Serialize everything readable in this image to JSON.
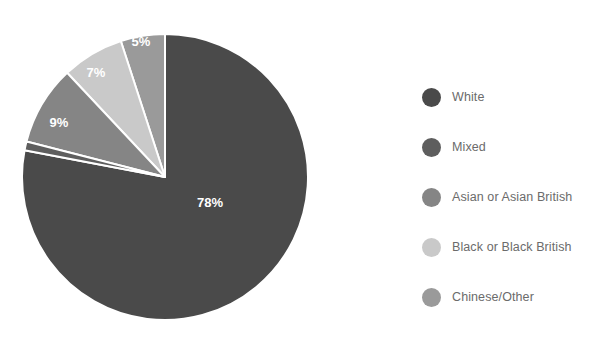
{
  "chart_data": {
    "type": "pie",
    "title": "",
    "xlabel": "",
    "ylabel": "",
    "unit": "%",
    "legend_position": "right",
    "grid": false,
    "start_angle_deg": 0,
    "direction": "clockwise",
    "categories": [
      "White",
      "Mixed",
      "Asian or Asian British",
      "Black or Black British",
      "Chinese/Other"
    ],
    "values": [
      78,
      1,
      9,
      7,
      5
    ],
    "data_labels": [
      "78%",
      "",
      "9%",
      "7%",
      "5%"
    ],
    "colors": [
      "#4a4a4a",
      "#5e5e5e",
      "#858585",
      "#c9c9c9",
      "#9a9a9a"
    ],
    "slices": [
      {
        "label": "White",
        "value": 78,
        "display": "78%",
        "color": "#4a4a4a",
        "label_shown": true
      },
      {
        "label": "Mixed",
        "value": 1,
        "display": "",
        "color": "#5e5e5e",
        "label_shown": false
      },
      {
        "label": "Asian or Asian British",
        "value": 9,
        "display": "9%",
        "color": "#858585",
        "label_shown": true
      },
      {
        "label": "Black or Black British",
        "value": 7,
        "display": "7%",
        "color": "#c9c9c9",
        "label_shown": true
      },
      {
        "label": "Chinese/Other",
        "value": 5,
        "display": "5%",
        "color": "#9a9a9a",
        "label_shown": true
      }
    ]
  },
  "pie": {
    "center_x": 165,
    "center_y": 177,
    "radius": 143,
    "separator_color": "#ffffff",
    "separator_width": 2,
    "label_color": "#ffffff",
    "labels": [
      {
        "name": "label-78",
        "text": "78%",
        "x": 210,
        "y": 204
      },
      {
        "name": "label-9",
        "text": "9%",
        "x": 59,
        "y": 124
      },
      {
        "name": "label-7",
        "text": "7%",
        "x": 96,
        "y": 74
      },
      {
        "name": "label-5",
        "text": "5%",
        "x": 141,
        "y": 43
      }
    ]
  },
  "legend": {
    "items": [
      {
        "label": "White",
        "color": "#4a4a4a"
      },
      {
        "label": "Mixed",
        "color": "#5e5e5e"
      },
      {
        "label": "Asian or Asian British",
        "color": "#858585"
      },
      {
        "label": "Black or Black British",
        "color": "#c9c9c9"
      },
      {
        "label": "Chinese/Other",
        "color": "#9a9a9a"
      }
    ]
  },
  "page": {
    "background": "#ffffff",
    "title_fragment": ""
  }
}
